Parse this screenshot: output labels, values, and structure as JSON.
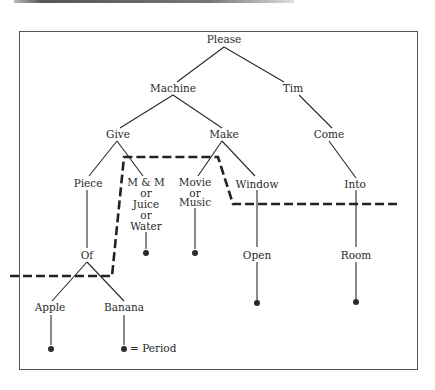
{
  "diagram": {
    "type": "tree",
    "colors": {
      "line": "#2a2a2a",
      "dashed_boundary": "#222222",
      "frame": "#555555",
      "background": "#ffffff"
    },
    "nodes": {
      "please": {
        "label": "Please",
        "x": 224,
        "y": 43
      },
      "machine": {
        "label": "Machine",
        "x": 173,
        "y": 91
      },
      "tim": {
        "label": "Tim",
        "x": 293,
        "y": 91
      },
      "give": {
        "label": "Give",
        "x": 118,
        "y": 137
      },
      "make": {
        "label": "Make",
        "x": 224,
        "y": 137
      },
      "come": {
        "label": "Come",
        "x": 329,
        "y": 137
      },
      "piece": {
        "label": "Piece",
        "x": 88,
        "y": 187
      },
      "mm": {
        "lines": [
          "M & M",
          "or",
          "Juice",
          "or",
          "Water"
        ],
        "x": 146,
        "y": 186
      },
      "movie": {
        "lines": [
          "Movie",
          "or",
          "Music"
        ],
        "x": 195,
        "y": 186
      },
      "window": {
        "label": "Window",
        "x": 257,
        "y": 187
      },
      "into": {
        "label": "Into",
        "x": 355,
        "y": 187
      },
      "of": {
        "label": "Of",
        "x": 87,
        "y": 259
      },
      "open": {
        "label": "Open",
        "x": 257,
        "y": 258
      },
      "room": {
        "label": "Room",
        "x": 356,
        "y": 258
      },
      "apple": {
        "label": "Apple",
        "x": 50,
        "y": 311
      },
      "banana": {
        "label": "Banana",
        "x": 124,
        "y": 311
      }
    },
    "legend": {
      "symbol": "●",
      "text": "= Period"
    }
  }
}
